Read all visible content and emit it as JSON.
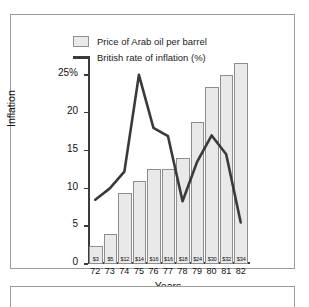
{
  "chart_data": {
    "type": "bar",
    "title": "",
    "subtitle": "",
    "xlabel": "Years",
    "ylabel": "Inflation",
    "categories": [
      "72",
      "73",
      "74",
      "75",
      "76",
      "77",
      "78",
      "79",
      "80",
      "81",
      "82"
    ],
    "ylim": [
      0,
      27.5
    ],
    "yticks": [
      0,
      5,
      10,
      15,
      20,
      25
    ],
    "ytick_labels": [
      "0",
      "5",
      "10",
      "15",
      "20",
      "25%"
    ],
    "grid": false,
    "legend_position": "top",
    "series": [
      {
        "name": "Price of Arab oil per barrel",
        "type": "bar",
        "unit": "$",
        "values": [
          3,
          5,
          12,
          14,
          16,
          16,
          18,
          24,
          30,
          32,
          34
        ],
        "data_labels": [
          "$3",
          "$5",
          "$12",
          "$14",
          "$16",
          "$16",
          "$18",
          "$24",
          "$30",
          "$32",
          "$34"
        ],
        "color": "#e9e9e9",
        "border_color": "#8d8d8d"
      },
      {
        "name": "British rate of inflation (%)",
        "type": "line",
        "unit": "%",
        "values": [
          8.5,
          10.0,
          12.2,
          25.0,
          18.0,
          16.9,
          8.3,
          13.5,
          17.0,
          14.5,
          5.5
        ],
        "color": "#3a3a3a"
      }
    ]
  },
  "legend": {
    "items": [
      {
        "label": "Price of Arab oil per barrel",
        "marker": "bar-swatch-icon"
      },
      {
        "label": "British rate of inflation (%)",
        "marker": "line-swatch-icon"
      }
    ]
  },
  "axes": {
    "y_title": "Inflation",
    "x_title": "Years"
  }
}
